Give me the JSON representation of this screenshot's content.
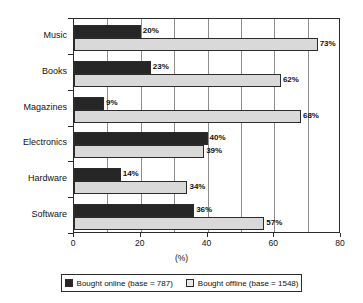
{
  "chart_data": {
    "type": "bar",
    "orientation": "horizontal",
    "title": "",
    "xlabel": "(%)",
    "ylabel": "",
    "xlim": [
      0,
      80
    ],
    "xticks": [
      0,
      20,
      40,
      60,
      80
    ],
    "xtick_labels": [
      "0",
      "20",
      "40",
      "60",
      "80"
    ],
    "gridline_step": 10,
    "grid": true,
    "legend_position": "bottom",
    "categories": [
      "Music",
      "Books",
      "Magazines",
      "Electronics",
      "Hardware",
      "Software"
    ],
    "series": [
      {
        "name": "Bought online (base = 787)",
        "color": "#262626",
        "values": [
          20,
          23,
          9,
          40,
          14,
          36
        ],
        "labels": [
          "20%",
          "23%",
          "9%",
          "40%",
          "14%",
          "36%"
        ]
      },
      {
        "name": "Bought offline (base = 1548)",
        "color": "#d9d9d9",
        "values": [
          73,
          62,
          68,
          39,
          34,
          57
        ],
        "labels": [
          "73%",
          "62%",
          "68%",
          "39%",
          "34%",
          "57%"
        ]
      }
    ]
  },
  "axis": {
    "x_title": "(%)",
    "tick_labels": [
      "0",
      "20",
      "40",
      "60",
      "80"
    ]
  },
  "legend": {
    "entries": [
      {
        "label": "Bought online (base = 787)",
        "swatch": "online"
      },
      {
        "label": "Bought offline (base = 1548)",
        "swatch": "offline"
      }
    ]
  }
}
